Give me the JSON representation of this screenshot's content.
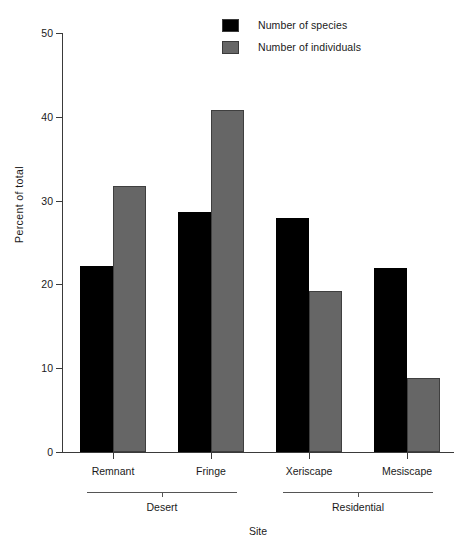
{
  "chart_data": {
    "type": "bar",
    "title": "",
    "xlabel": "Site",
    "ylabel": "Percent of total",
    "categories": [
      "Remnant",
      "Fringe",
      "Xeriscape",
      "Mesiscape"
    ],
    "group_labels": [
      "Desert",
      "Residential"
    ],
    "groups": [
      {
        "label": "Desert",
        "categories": [
          "Remnant",
          "Fringe"
        ]
      },
      {
        "label": "Residential",
        "categories": [
          "Xeriscape",
          "Mesiscape"
        ]
      }
    ],
    "series": [
      {
        "name": "Number of species",
        "color": "#000000",
        "values": [
          22.2,
          28.6,
          27.9,
          22.0
        ]
      },
      {
        "name": "Number of individuals",
        "color": "#666666",
        "values": [
          31.7,
          40.8,
          19.2,
          8.8
        ]
      }
    ],
    "ylim": [
      0,
      50
    ],
    "yticks": [
      0,
      10,
      20,
      30,
      40,
      50
    ],
    "ytick_labels": [
      "0",
      "10",
      "20",
      "30",
      "40",
      "50"
    ],
    "grid": false,
    "legend_position": "top-right"
  },
  "legend": {
    "items": [
      {
        "label": "Number of species",
        "color": "#000000"
      },
      {
        "label": "Number of individuals",
        "color": "#666666"
      }
    ]
  },
  "axes": {
    "y_title": "Percent of total",
    "x_title": "Site"
  }
}
